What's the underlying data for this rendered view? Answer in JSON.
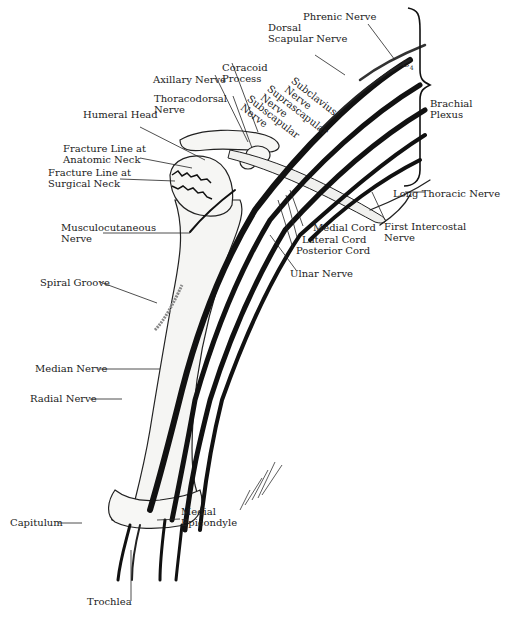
{
  "figure": {
    "type": "anatomical-illustration",
    "signature": "artist signature (illegible)"
  },
  "labels": {
    "phrenic_nerve": "Phrenic Nerve",
    "dorsal_scapular_nerve": "Dorsal\nScapular Nerve",
    "c4": "C",
    "c4_sub": "4",
    "brachial_plexus": "Brachial\nPlexus",
    "coracoid_process": "Coracoid\nProcess",
    "axillary_nerve": "Axillary Nerve",
    "thoracodorsal_nerve": "Thoracodorsal\nNerve",
    "subclavius_nerve": "Subclavius\nNerve",
    "suprascapular_nerve": "Suprascapular\nNerve",
    "subscapular_nerve": "Subscapular\nNerve",
    "humeral_head": "Humeral Head",
    "fracture_anatomic_neck": "Fracture Line at\nAnatomic Neck",
    "fracture_surgical_neck": "Fracture Line at\nSurgical Neck",
    "long_thoracic_nerve": "Long Thoracic Nerve",
    "medial_cord": "Medial Cord",
    "lateral_cord": "Lateral Cord",
    "posterior_cord": "Posterior Cord",
    "first_intercostal_nerve": "First Intercostal\nNerve",
    "ulnar_nerve": "Ulnar Nerve",
    "musculocutaneous_nerve": "Musculocutaneous\nNerve",
    "spiral_groove": "Spiral Groove",
    "median_nerve": "Median Nerve",
    "radial_nerve": "Radial Nerve",
    "capitulum": "Capitulum",
    "medial_epicondyle": "Medial\nEpicondyle",
    "trochlea": "Trochlea"
  },
  "colors": {
    "ink": "#1a1a1a",
    "paper": "#ffffff",
    "bone": "#f4f4f2",
    "text": "#222222"
  }
}
